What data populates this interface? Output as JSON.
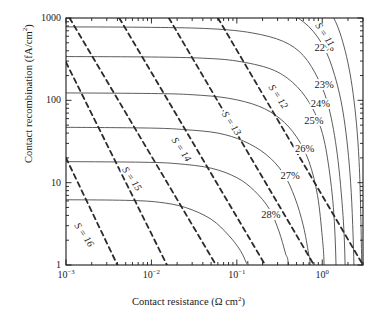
{
  "chart_data": {
    "type": "line",
    "title": "",
    "xlabel": "Contact resistance (Ω cm²)",
    "ylabel": "Contact recombination (fA/cm²)",
    "xscale": "log",
    "yscale": "log",
    "xlim": [
      0.001,
      3.0
    ],
    "ylim": [
      1,
      1000
    ],
    "grid": false,
    "legend": "none",
    "xticks": [
      {
        "value": 0.001,
        "label": "10⁻³",
        "mantissa": "10",
        "exponent": "-3"
      },
      {
        "value": 0.01,
        "label": "10⁻²",
        "mantissa": "10",
        "exponent": "-2"
      },
      {
        "value": 0.1,
        "label": "10⁻¹",
        "mantissa": "10",
        "exponent": "-1"
      },
      {
        "value": 1.0,
        "label": "10⁰",
        "mantissa": "10",
        "exponent": "0"
      }
    ],
    "yticks": [
      {
        "value": 1,
        "label": "1"
      },
      {
        "value": 10,
        "label": "10"
      },
      {
        "value": 100,
        "label": "100"
      },
      {
        "value": 1000,
        "label": "1000"
      }
    ],
    "series": [
      {
        "name": "22%",
        "kind": "efficiency-contour",
        "style": "solid",
        "label": "22%",
        "label_xy": [
          1.05,
          430
        ],
        "left_asymptote_y": 4000,
        "bottom_asymptote_x": 2.9,
        "points": [
          [
            0.001,
            4000
          ],
          [
            0.01,
            3900
          ],
          [
            0.1,
            3500
          ],
          [
            0.4,
            2800
          ],
          [
            0.8,
            2000
          ],
          [
            1.3,
            1100
          ],
          [
            1.8,
            450
          ],
          [
            2.3,
            120
          ],
          [
            2.7,
            18
          ],
          [
            2.9,
            1
          ]
        ]
      },
      {
        "name": "23%",
        "kind": "efficiency-contour",
        "style": "solid",
        "label": "23%",
        "label_xy": [
          1.05,
          150
        ],
        "left_asymptote_y": 1700,
        "bottom_asymptote_x": 2.35,
        "points": [
          [
            0.001,
            1700
          ],
          [
            0.01,
            1650
          ],
          [
            0.1,
            1480
          ],
          [
            0.3,
            1250
          ],
          [
            0.6,
            900
          ],
          [
            1.0,
            480
          ],
          [
            1.4,
            200
          ],
          [
            1.8,
            60
          ],
          [
            2.15,
            10
          ],
          [
            2.35,
            1
          ]
        ]
      },
      {
        "name": "24%",
        "kind": "efficiency-contour",
        "style": "solid",
        "label": "24%",
        "label_xy": [
          0.95,
          90
        ],
        "left_asymptote_y": 780,
        "bottom_asymptote_x": 1.85,
        "points": [
          [
            0.001,
            780
          ],
          [
            0.01,
            770
          ],
          [
            0.05,
            740
          ],
          [
            0.15,
            660
          ],
          [
            0.35,
            520
          ],
          [
            0.6,
            350
          ],
          [
            0.9,
            180
          ],
          [
            1.2,
            80
          ],
          [
            1.5,
            22
          ],
          [
            1.75,
            4
          ],
          [
            1.85,
            1
          ]
        ]
      },
      {
        "name": "25%",
        "kind": "efficiency-contour",
        "style": "solid",
        "label": "25%",
        "label_xy": [
          0.8,
          55
        ],
        "left_asymptote_y": 340,
        "bottom_asymptote_x": 1.45,
        "points": [
          [
            0.001,
            340
          ],
          [
            0.01,
            336
          ],
          [
            0.04,
            325
          ],
          [
            0.1,
            300
          ],
          [
            0.25,
            240
          ],
          [
            0.45,
            165
          ],
          [
            0.7,
            95
          ],
          [
            0.95,
            48
          ],
          [
            1.15,
            20
          ],
          [
            1.35,
            5
          ],
          [
            1.45,
            1
          ]
        ]
      },
      {
        "name": "26%",
        "kind": "efficiency-contour",
        "style": "solid",
        "label": "26%",
        "label_xy": [
          0.62,
          25
        ],
        "left_asymptote_y": 123,
        "bottom_asymptote_x": 1.05,
        "points": [
          [
            0.001,
            123
          ],
          [
            0.01,
            121
          ],
          [
            0.03,
            117
          ],
          [
            0.08,
            106
          ],
          [
            0.18,
            85
          ],
          [
            0.32,
            60
          ],
          [
            0.5,
            36
          ],
          [
            0.7,
            18
          ],
          [
            0.88,
            7
          ],
          [
            1.0,
            2.2
          ],
          [
            1.05,
            1
          ]
        ]
      },
      {
        "name": "27%",
        "kind": "efficiency-contour",
        "style": "solid",
        "label": "27%",
        "label_xy": [
          0.42,
          12
        ],
        "left_asymptote_y": 47,
        "bottom_asymptote_x": 0.72,
        "points": [
          [
            0.001,
            47
          ],
          [
            0.01,
            46
          ],
          [
            0.025,
            44
          ],
          [
            0.06,
            40
          ],
          [
            0.12,
            32
          ],
          [
            0.22,
            22
          ],
          [
            0.35,
            13
          ],
          [
            0.48,
            6.5
          ],
          [
            0.6,
            3
          ],
          [
            0.69,
            1.4
          ],
          [
            0.72,
            1
          ]
        ]
      },
      {
        "name": "28%",
        "kind": "efficiency-contour",
        "style": "solid",
        "label": "28%",
        "label_xy": [
          0.25,
          4.0
        ],
        "left_asymptote_y": 18,
        "bottom_asymptote_x": 0.4,
        "points": [
          [
            0.001,
            18
          ],
          [
            0.008,
            17.7
          ],
          [
            0.02,
            17
          ],
          [
            0.05,
            15
          ],
          [
            0.1,
            11.5
          ],
          [
            0.16,
            8
          ],
          [
            0.24,
            4.8
          ],
          [
            0.31,
            2.6
          ],
          [
            0.37,
            1.4
          ],
          [
            0.4,
            1
          ]
        ]
      },
      {
        "name": "29%",
        "kind": "efficiency-contour",
        "style": "solid",
        "label": "",
        "left_asymptote_y": 6.2,
        "bottom_asymptote_x": 0.135,
        "points": [
          [
            0.001,
            6.2
          ],
          [
            0.005,
            6.1
          ],
          [
            0.012,
            5.8
          ],
          [
            0.025,
            5.0
          ],
          [
            0.05,
            3.6
          ],
          [
            0.08,
            2.3
          ],
          [
            0.11,
            1.5
          ],
          [
            0.13,
            1.05
          ],
          [
            0.135,
            1
          ]
        ]
      },
      {
        "name": "S = 11",
        "kind": "s-isoline",
        "style": "dashed",
        "label": "S = 11",
        "label_xy": [
          1.05,
          620
        ],
        "points": [
          [
            0.06,
            1000
          ],
          [
            3.0,
            1.0
          ]
        ]
      },
      {
        "name": "S = 12",
        "kind": "s-isoline",
        "style": "dashed",
        "label": "S = 12",
        "label_xy": [
          0.3,
          110
        ],
        "points": [
          [
            0.016,
            1000
          ],
          [
            0.8,
            1.0
          ]
        ]
      },
      {
        "name": "S = 13",
        "kind": "s-isoline",
        "style": "dashed",
        "label": "S = 13",
        "label_xy": [
          0.085,
          52
        ],
        "points": [
          [
            0.0042,
            1000
          ],
          [
            0.215,
            1.0
          ]
        ]
      },
      {
        "name": "S = 14",
        "kind": "s-isoline",
        "style": "dashed",
        "label": "S = 14",
        "label_xy": [
          0.022,
          25
        ],
        "points": [
          [
            0.0011,
            1000
          ],
          [
            0.057,
            1.0
          ]
        ]
      },
      {
        "name": "S = 15",
        "kind": "s-isoline",
        "style": "dashed",
        "label": "S = 15",
        "label_xy": [
          0.0058,
          11
        ],
        "points": [
          [
            0.001,
            290
          ],
          [
            0.0152,
            1.0
          ]
        ]
      },
      {
        "name": "S = 16",
        "kind": "s-isoline",
        "style": "dashed",
        "label": "S = 16",
        "label_xy": [
          0.0016,
          2.3
        ],
        "points": [
          [
            0.001,
            20
          ],
          [
            0.004,
            1.0
          ]
        ]
      }
    ]
  },
  "colors": {
    "axis": "#1a1a1a",
    "contour": "#4a4a4a",
    "isoline": "#2b2b2b",
    "background": "#ffffff"
  }
}
